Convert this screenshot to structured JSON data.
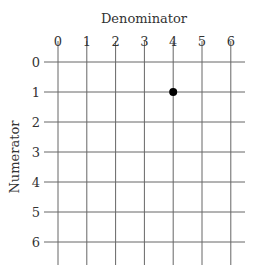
{
  "diagram": {
    "x_axis_title": "Denominator",
    "y_axis_title": "Numerator",
    "columns": [
      "0",
      "1",
      "2",
      "3",
      "4",
      "5",
      "6"
    ],
    "rows": [
      "0",
      "1",
      "2",
      "3",
      "4",
      "5",
      "6"
    ],
    "points": [
      {
        "col": 4,
        "row": 1
      }
    ],
    "grid_color": "#666666",
    "point_color": "#000000"
  }
}
